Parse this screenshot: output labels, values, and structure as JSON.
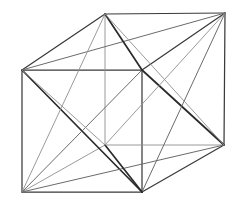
{
  "figure": {
    "kind": "line-drawing",
    "background_color": "#ffffff",
    "canvas": {
      "width": 237,
      "height": 201
    },
    "stroke_colors": {
      "faint": "#8e8e8e",
      "thin": "#6b6b6b",
      "main": "#3a3a3a",
      "bold": "#2a2a2a"
    },
    "projection": {
      "type": "oblique-parallel",
      "depth_offset_x": 83,
      "depth_offset_y": -57
    },
    "vertices": {
      "front_top_left": {
        "id": "A",
        "x": 22,
        "y": 70
      },
      "front_top_right": {
        "id": "B",
        "x": 142,
        "y": 70
      },
      "front_bottom_right": {
        "id": "C",
        "x": 142,
        "y": 192
      },
      "front_bottom_left": {
        "id": "D",
        "x": 22,
        "y": 192
      },
      "back_top_left": {
        "id": "E",
        "x": 105,
        "y": 14
      },
      "back_top_right": {
        "id": "F",
        "x": 225,
        "y": 13
      },
      "back_bottom_right": {
        "id": "G",
        "x": 224,
        "y": 145
      },
      "back_bottom_left": {
        "id": "H",
        "x": 105,
        "y": 145
      }
    },
    "edges": [
      {
        "name": "front-face-top",
        "from": "A",
        "to": "B",
        "weight": "main"
      },
      {
        "name": "front-face-right",
        "from": "B",
        "to": "C",
        "weight": "main"
      },
      {
        "name": "front-face-bottom",
        "from": "C",
        "to": "D",
        "weight": "main"
      },
      {
        "name": "front-face-left",
        "from": "D",
        "to": "A",
        "weight": "main"
      },
      {
        "name": "back-face-top",
        "from": "E",
        "to": "F",
        "weight": "main"
      },
      {
        "name": "back-face-right",
        "from": "F",
        "to": "G",
        "weight": "main"
      },
      {
        "name": "back-face-bottom",
        "from": "G",
        "to": "H",
        "weight": "faint"
      },
      {
        "name": "back-face-left",
        "from": "H",
        "to": "E",
        "weight": "faint"
      },
      {
        "name": "connector-top-left",
        "from": "A",
        "to": "E",
        "weight": "main"
      },
      {
        "name": "connector-top-right",
        "from": "B",
        "to": "F",
        "weight": "main"
      },
      {
        "name": "connector-bot-right",
        "from": "C",
        "to": "G",
        "weight": "main"
      },
      {
        "name": "connector-bot-left",
        "from": "D",
        "to": "H",
        "weight": "faint"
      }
    ],
    "diagonals": [
      {
        "name": "front-face-diagonal-main",
        "from": "A",
        "to": "C",
        "weight": "bold"
      },
      {
        "name": "front-face-diagonal-alt",
        "from": "D",
        "to": "B",
        "weight": "thin"
      },
      {
        "name": "top-face-diagonal-main",
        "from": "A",
        "to": "F",
        "weight": "thin"
      },
      {
        "name": "top-face-diagonal-alt",
        "from": "E",
        "to": "B",
        "weight": "bold"
      },
      {
        "name": "right-face-diagonal-main",
        "from": "B",
        "to": "G",
        "weight": "bold"
      },
      {
        "name": "right-face-diagonal-alt",
        "from": "F",
        "to": "C",
        "weight": "thin"
      },
      {
        "name": "bottom-face-diagonal-main",
        "from": "D",
        "to": "G",
        "weight": "thin"
      },
      {
        "name": "bottom-face-diagonal-alt",
        "from": "H",
        "to": "C",
        "weight": "bold"
      },
      {
        "name": "left-face-diagonal-main",
        "from": "A",
        "to": "H",
        "weight": "faint"
      },
      {
        "name": "left-face-diagonal-alt",
        "from": "E",
        "to": "D",
        "weight": "faint"
      },
      {
        "name": "back-face-diagonal-main",
        "from": "E",
        "to": "G",
        "weight": "faint"
      },
      {
        "name": "back-face-diagonal-alt",
        "from": "F",
        "to": "H",
        "weight": "faint"
      }
    ],
    "labels": []
  }
}
